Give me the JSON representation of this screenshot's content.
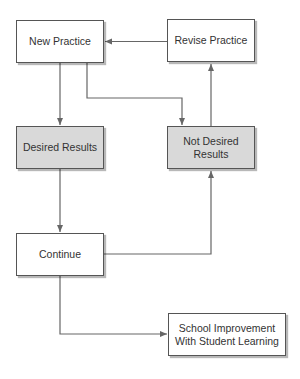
{
  "diagram": {
    "type": "flowchart",
    "nodes": [
      {
        "id": "new_practice",
        "label": "New Practice",
        "fill": "#ffffff"
      },
      {
        "id": "revise_practice",
        "label": "Revise Practice",
        "fill": "#ffffff"
      },
      {
        "id": "desired_results",
        "label": "Desired Results",
        "fill": "#d9d9d9"
      },
      {
        "id": "not_desired_results",
        "label": "Not Desired Results",
        "fill": "#d9d9d9"
      },
      {
        "id": "continue",
        "label": "Continue",
        "fill": "#ffffff"
      },
      {
        "id": "school_improvement",
        "label": "School Improvement With Student Learning",
        "fill": "#ffffff"
      }
    ],
    "edges": [
      {
        "from": "new_practice",
        "to": "desired_results"
      },
      {
        "from": "new_practice",
        "to": "not_desired_results"
      },
      {
        "from": "revise_practice",
        "to": "new_practice"
      },
      {
        "from": "not_desired_results",
        "to": "revise_practice"
      },
      {
        "from": "desired_results",
        "to": "continue"
      },
      {
        "from": "continue",
        "to": "not_desired_results"
      },
      {
        "from": "continue",
        "to": "school_improvement"
      }
    ],
    "colors": {
      "line": "#666666",
      "border": "#555555",
      "shaded_fill": "#d9d9d9"
    }
  }
}
